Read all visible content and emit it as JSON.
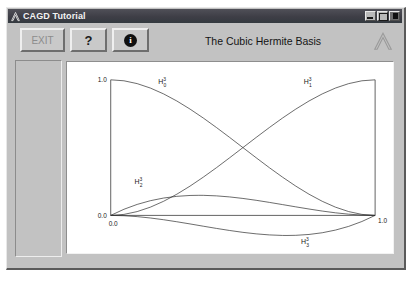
{
  "window": {
    "title": "CAGD Tutorial",
    "title_icon": "lambda-logo-icon",
    "controls": [
      {
        "name": "minimize",
        "glyph": "minimize-icon"
      },
      {
        "name": "maximize",
        "glyph": "maximize-icon"
      },
      {
        "name": "close",
        "glyph": "close-icon"
      }
    ]
  },
  "toolbar": {
    "exit_label": "EXIT",
    "help_label": "?",
    "info_label": "i",
    "title": "The Cubic Hermite Basis",
    "logo": "lambda-logo-icon"
  },
  "sidebar": {
    "items": []
  },
  "chart_data": {
    "type": "line",
    "title": "The Cubic Hermite Basis",
    "xlabel": "",
    "ylabel": "",
    "xlim": [
      0.0,
      1.0
    ],
    "ylim": [
      -0.16,
      1.0
    ],
    "grid": false,
    "legend": "inline-labels",
    "x_ticks": [
      "0.0",
      "1.0"
    ],
    "y_ticks": [
      "0.0",
      "1.0"
    ],
    "series": [
      {
        "name": "H_0^3",
        "label_base": "H",
        "label_sub": "0",
        "label_sup": "3",
        "formula": "2t^3 - 3t^2 + 1",
        "x": [
          0.0,
          0.05,
          0.1,
          0.15,
          0.2,
          0.25,
          0.3,
          0.35,
          0.4,
          0.45,
          0.5,
          0.55,
          0.6,
          0.65,
          0.7,
          0.75,
          0.8,
          0.85,
          0.9,
          0.95,
          1.0
        ],
        "values": [
          1.0,
          0.9928,
          0.972,
          0.9393,
          0.896,
          0.8438,
          0.784,
          0.7183,
          0.648,
          0.5748,
          0.5,
          0.4253,
          0.352,
          0.2818,
          0.216,
          0.1563,
          0.104,
          0.0608,
          0.028,
          0.0073,
          0.0
        ]
      },
      {
        "name": "H_1^3",
        "label_base": "H",
        "label_sub": "1",
        "label_sup": "3",
        "formula": "t^3 - 2t^2 + t",
        "x": [
          0.0,
          0.05,
          0.1,
          0.15,
          0.2,
          0.25,
          0.3,
          0.3333,
          0.35,
          0.4,
          0.45,
          0.5,
          0.55,
          0.6,
          0.65,
          0.7,
          0.75,
          0.8,
          0.85,
          0.9,
          0.95,
          1.0
        ],
        "values": [
          0.0,
          0.0451,
          0.081,
          0.1084,
          0.128,
          0.1406,
          0.147,
          0.1481,
          0.1479,
          0.144,
          0.1361,
          0.125,
          0.1114,
          0.096,
          0.0796,
          0.063,
          0.0469,
          0.032,
          0.0191,
          0.009,
          0.0024,
          0.0
        ]
      },
      {
        "name": "H_2^3",
        "label_base": "H",
        "label_sub": "2",
        "label_sup": "3",
        "formula": "t^3 - t^2",
        "x": [
          0.0,
          0.05,
          0.1,
          0.15,
          0.2,
          0.25,
          0.3,
          0.35,
          0.4,
          0.45,
          0.5,
          0.55,
          0.6,
          0.65,
          0.6667,
          0.7,
          0.75,
          0.8,
          0.85,
          0.9,
          0.95,
          1.0
        ],
        "values": [
          0.0,
          -0.0024,
          -0.009,
          -0.0191,
          -0.032,
          -0.0469,
          -0.063,
          -0.0796,
          -0.096,
          -0.1114,
          -0.125,
          -0.1361,
          -0.144,
          -0.1479,
          -0.1481,
          -0.147,
          -0.1406,
          -0.128,
          -0.1084,
          -0.081,
          -0.0451,
          0.0
        ]
      },
      {
        "name": "H_3^3",
        "label_base": "H",
        "label_sub": "3",
        "label_sup": "3",
        "formula": "-2t^3 + 3t^2",
        "x": [
          0.0,
          0.05,
          0.1,
          0.15,
          0.2,
          0.25,
          0.3,
          0.35,
          0.4,
          0.45,
          0.5,
          0.55,
          0.6,
          0.65,
          0.7,
          0.75,
          0.8,
          0.85,
          0.9,
          0.95,
          1.0
        ],
        "values": [
          0.0,
          0.0073,
          0.028,
          0.0608,
          0.104,
          0.1563,
          0.216,
          0.2818,
          0.352,
          0.4253,
          0.5,
          0.5748,
          0.648,
          0.7183,
          0.784,
          0.8438,
          0.896,
          0.9393,
          0.972,
          0.9928,
          1.0
        ]
      }
    ],
    "annotations": [
      {
        "text": "H_0^3",
        "x": 0.18,
        "y": 0.97
      },
      {
        "text": "H_3^3",
        "x": 0.73,
        "y": 0.97
      },
      {
        "text": "H_1^3",
        "x": 0.09,
        "y": 0.23
      },
      {
        "text": "H_2^3",
        "x": 0.72,
        "y": -0.21
      }
    ]
  }
}
